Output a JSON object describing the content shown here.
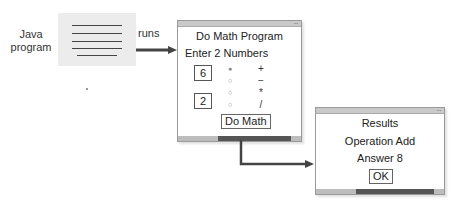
{
  "left": {
    "label_line1": "Java",
    "label_line2": "program",
    "arrow_label": "runs"
  },
  "math_window": {
    "title": "Do Math Program",
    "prompt": "Enter 2 Numbers",
    "number1": "6",
    "number2": "2",
    "operations": [
      {
        "symbol": "+",
        "selected": true
      },
      {
        "symbol": "−",
        "selected": false
      },
      {
        "symbol": "*",
        "selected": false
      },
      {
        "symbol": "/",
        "selected": false
      }
    ],
    "radio_selected_glyph": "●",
    "radio_unselected_glyph": "○",
    "button_label": "Do Math"
  },
  "results_window": {
    "title": "Results",
    "operation": "Operation Add",
    "answer": "Answer 8",
    "button_label": "OK"
  },
  "colors": {
    "arrow": "#444444",
    "code_box": "#ececec",
    "status_dark": "#555555",
    "titlebar": "#c9c9c9"
  }
}
